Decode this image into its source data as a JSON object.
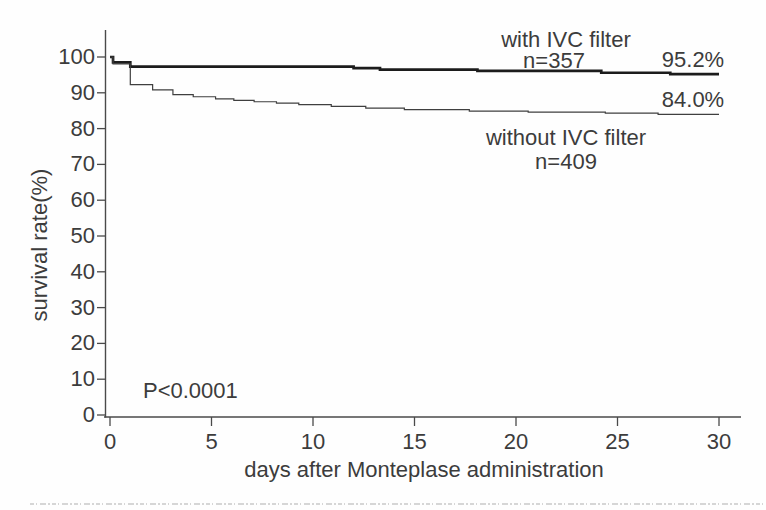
{
  "figure": {
    "background_color": "#fefefe",
    "line_color_primary": "#1c1c1c",
    "line_color_secondary": "#3f3f3f",
    "axis_color": "#4a4a4a",
    "text_color": "#3c3c3c",
    "scan_artifact_color": "#c9c9c9"
  },
  "chart_data": {
    "type": "line",
    "subtype": "kaplan-meier-step",
    "title": "",
    "xlabel": "days after Monteplase administration",
    "ylabel": "survival rate(%)",
    "xlim": [
      0,
      30
    ],
    "ylim": [
      0,
      100
    ],
    "xticks": [
      0,
      5,
      10,
      15,
      20,
      25,
      30
    ],
    "yticks": [
      0,
      10,
      20,
      30,
      40,
      50,
      60,
      70,
      80,
      90,
      100
    ],
    "grid": false,
    "legend_position": "annotated-on-chart",
    "annotations": {
      "p_value": "P<0.0001"
    },
    "series": [
      {
        "name": "with IVC filter",
        "n_label": "n=357",
        "n": 357,
        "final_value": 95.2,
        "final_value_label": "95.2%",
        "line_width": "thick",
        "steps": [
          [
            0,
            100
          ],
          [
            0.15,
            98.5
          ],
          [
            1,
            97.3
          ],
          [
            12,
            96.9
          ],
          [
            13.3,
            96.5
          ],
          [
            18.1,
            96.1
          ],
          [
            24.2,
            95.6
          ],
          [
            27.6,
            95.2
          ]
        ]
      },
      {
        "name": "without IVC filter",
        "n_label": "n=409",
        "n": 409,
        "final_value": 84.0,
        "final_value_label": "84.0%",
        "line_width": "thin",
        "steps": [
          [
            0,
            100
          ],
          [
            0.15,
            98.1
          ],
          [
            1,
            92.3
          ],
          [
            2.1,
            90.8
          ],
          [
            3.1,
            89.5
          ],
          [
            4.1,
            88.9
          ],
          [
            5.2,
            88.3
          ],
          [
            6.1,
            87.9
          ],
          [
            7.1,
            87.5
          ],
          [
            8.2,
            87.1
          ],
          [
            9.3,
            86.7
          ],
          [
            10.9,
            86.2
          ],
          [
            12.6,
            85.7
          ],
          [
            14.5,
            85.3
          ],
          [
            17.7,
            84.9
          ],
          [
            20.6,
            84.6
          ],
          [
            24.4,
            84.3
          ],
          [
            27,
            84.0
          ]
        ]
      }
    ]
  }
}
